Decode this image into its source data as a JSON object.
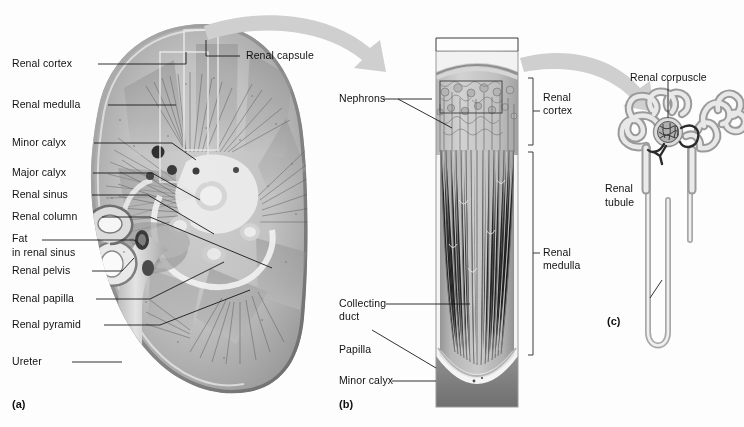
{
  "figure": {
    "background": "#fdfdfd",
    "ink": "#1a1a1a",
    "arrow_color": "#cfcfcf",
    "panels": [
      {
        "id": "panel-a",
        "tag": "(a)",
        "caption": "Coronal section of kidney"
      },
      {
        "id": "panel-b",
        "tag": "(b)",
        "caption": "Wedge of renal cortex and medulla"
      },
      {
        "id": "panel-c",
        "tag": "(c)",
        "caption": "Nephron"
      }
    ]
  },
  "panel_a": {
    "tag": "(a)",
    "labels": [
      {
        "name": "renal-cortex",
        "text": "Renal cortex"
      },
      {
        "name": "renal-medulla",
        "text": "Renal medulla"
      },
      {
        "name": "minor-calyx",
        "text": "Minor calyx"
      },
      {
        "name": "major-calyx",
        "text": "Major calyx"
      },
      {
        "name": "renal-sinus",
        "text": "Renal sinus"
      },
      {
        "name": "renal-column",
        "text": "Renal column"
      },
      {
        "name": "fat-line-1",
        "text": "Fat"
      },
      {
        "name": "fat-line-2",
        "text": "in renal sinus"
      },
      {
        "name": "renal-pelvis",
        "text": "Renal pelvis"
      },
      {
        "name": "renal-papilla",
        "text": "Renal papilla"
      },
      {
        "name": "renal-pyramid",
        "text": "Renal pyramid"
      },
      {
        "name": "ureter",
        "text": "Ureter"
      }
    ],
    "right_label": {
      "name": "renal-capsule",
      "text": "Renal capsule"
    }
  },
  "panel_b": {
    "tag": "(b)",
    "left_labels": [
      {
        "name": "nephrons",
        "text": "Nephrons"
      },
      {
        "name": "collecting-duct-1",
        "text": "Collecting"
      },
      {
        "name": "collecting-duct-2",
        "text": "duct"
      },
      {
        "name": "papilla",
        "text": "Papilla"
      },
      {
        "name": "minor-calyx",
        "text": "Minor calyx"
      }
    ],
    "bracket_labels": [
      {
        "name": "renal-cortex",
        "line1": "Renal",
        "line2": "cortex"
      },
      {
        "name": "renal-medulla",
        "line1": "Renal",
        "line2": "medulla"
      }
    ]
  },
  "panel_c": {
    "tag": "(c)",
    "labels": [
      {
        "name": "renal-corpuscle",
        "text": "Renal corpuscle"
      },
      {
        "name": "renal-tubule-1",
        "text": "Renal"
      },
      {
        "name": "renal-tubule-2",
        "text": "tubule"
      }
    ]
  }
}
